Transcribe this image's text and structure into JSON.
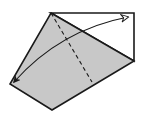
{
  "diagram": {
    "type": "origami-fold-step",
    "colors": {
      "paper_back": "#c8c8c8",
      "paper_front": "#ffffff",
      "line": "#1a1a1a",
      "background": "#ffffff"
    },
    "shapes": {
      "gray_flap": "51,13 134,61 52,110 10,84",
      "white_triangle": "51,13 134,13 134,61"
    },
    "valley_fold_line": {
      "x1": 51,
      "y1": 13,
      "x2": 92,
      "y2": 82
    },
    "fold_arrow": {
      "path": "M14,82 Q60,30 128,17",
      "start_head": "filled",
      "end_head": "hollow"
    }
  }
}
